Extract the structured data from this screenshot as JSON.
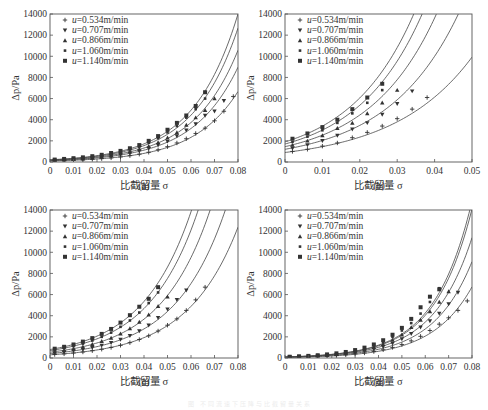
{
  "figure": {
    "caption": "图 不同流速下压降与比截留量关系"
  },
  "legend": {
    "prefix": "u",
    "items": [
      {
        "label": "=0.534m/min",
        "marker": "plus"
      },
      {
        "label": "=0.707m/min",
        "marker": "triangle-down"
      },
      {
        "label": "=0.866m/min",
        "marker": "triangle-up"
      },
      {
        "label": "=1.060m/min",
        "marker": "small-square"
      },
      {
        "label": "=1.140m/min",
        "marker": "square"
      }
    ]
  },
  "colors": {
    "line": "#444444",
    "marker": "#333333",
    "frame": "#555555"
  },
  "panels": [
    {
      "id": "a",
      "tag": "(a)",
      "ylabel": "Δp/Pa",
      "xlabel": "比截留量 σ"
    },
    {
      "id": "b",
      "tag": "(b)",
      "ylabel": "Δp/Pa",
      "xlabel": "比截留量 σ"
    },
    {
      "id": "c",
      "tag": "(c)",
      "ylabel": "Δp/Pa",
      "xlabel": "比截留量 σ"
    },
    {
      "id": "d",
      "tag": "(d)",
      "ylabel": "Δp/Pa",
      "xlabel": "比截留量 σ"
    }
  ],
  "chart_data": [
    {
      "panel": "(a)",
      "type": "scatter",
      "title": "",
      "xlabel": "比截留量 σ",
      "ylabel": "Δp/Pa",
      "xlim": [
        0,
        0.08
      ],
      "ylim": [
        0,
        14000
      ],
      "xticks": [
        0,
        0.01,
        0.02,
        0.03,
        0.04,
        0.05,
        0.06,
        0.07,
        0.08
      ],
      "xtick_labels": [
        "0",
        "0.01",
        "0.02",
        "0.03",
        "0.04",
        "0.05",
        "0.06",
        "0.07",
        "0.08"
      ],
      "yticks": [
        0,
        2000,
        4000,
        6000,
        8000,
        10000,
        12000,
        14000
      ],
      "legend_position": "upper left",
      "grid": false,
      "series": [
        {
          "name": "u=0.534m/min",
          "marker": "plus",
          "fit": {
            "A": 100,
            "k": 52.5
          },
          "x": [
            0.002,
            0.006,
            0.01,
            0.014,
            0.018,
            0.022,
            0.026,
            0.03,
            0.034,
            0.038,
            0.042,
            0.046,
            0.05,
            0.054,
            0.058,
            0.062,
            0.066,
            0.07,
            0.074,
            0.078
          ],
          "y": [
            110,
            130,
            160,
            200,
            250,
            320,
            390,
            480,
            600,
            740,
            920,
            1150,
            1450,
            1800,
            2200,
            2700,
            3200,
            3900,
            4800,
            6200
          ]
        },
        {
          "name": "u=0.707m/min",
          "marker": "triangle-down",
          "fit": {
            "A": 140,
            "k": 52
          },
          "x": [
            0.002,
            0.006,
            0.01,
            0.014,
            0.018,
            0.022,
            0.026,
            0.03,
            0.034,
            0.038,
            0.042,
            0.046,
            0.05,
            0.054,
            0.058,
            0.062,
            0.066,
            0.07,
            0.074
          ],
          "y": [
            150,
            190,
            230,
            290,
            360,
            440,
            550,
            680,
            830,
            1030,
            1280,
            1600,
            1950,
            2450,
            3000,
            3600,
            4400,
            4800,
            5800
          ]
        },
        {
          "name": "u=0.866m/min",
          "marker": "triangle-up",
          "fit": {
            "A": 165,
            "k": 52
          },
          "x": [
            0.002,
            0.006,
            0.01,
            0.014,
            0.018,
            0.022,
            0.026,
            0.03,
            0.034,
            0.038,
            0.042,
            0.046,
            0.05,
            0.054,
            0.058,
            0.062,
            0.066,
            0.07
          ],
          "y": [
            180,
            220,
            280,
            340,
            420,
            520,
            650,
            800,
            980,
            1230,
            1500,
            1850,
            2300,
            2800,
            3500,
            4200,
            4900,
            6000
          ]
        },
        {
          "name": "u=1.060m/min",
          "marker": "small-square",
          "fit": {
            "A": 190,
            "k": 52.5
          },
          "x": [
            0.002,
            0.006,
            0.01,
            0.014,
            0.018,
            0.022,
            0.026,
            0.03,
            0.034,
            0.038,
            0.042,
            0.046,
            0.05,
            0.054,
            0.058,
            0.062,
            0.066
          ],
          "y": [
            210,
            260,
            320,
            400,
            500,
            620,
            770,
            950,
            1180,
            1460,
            1820,
            2250,
            2800,
            3400,
            4200,
            5000,
            6000
          ]
        },
        {
          "name": "u=1.140m/min",
          "marker": "square",
          "fit": {
            "A": 210,
            "k": 52.5
          },
          "x": [
            0.002,
            0.006,
            0.01,
            0.014,
            0.018,
            0.022,
            0.026,
            0.03,
            0.034,
            0.038,
            0.042,
            0.046,
            0.05,
            0.054,
            0.058,
            0.062,
            0.066
          ],
          "y": [
            230,
            290,
            360,
            440,
            550,
            680,
            850,
            1050,
            1300,
            1600,
            2000,
            2450,
            3050,
            3700,
            4400,
            5300,
            6600
          ]
        }
      ]
    },
    {
      "panel": "(b)",
      "type": "scatter",
      "title": "",
      "xlabel": "比截留量 σ",
      "ylabel": "Δp/Pa",
      "xlim": [
        0,
        0.05
      ],
      "ylim": [
        0,
        14000
      ],
      "xticks": [
        0,
        0.01,
        0.02,
        0.03,
        0.04,
        0.05
      ],
      "xtick_labels": [
        "0",
        "0.01",
        "0.02",
        "0.03",
        "0.04",
        "0.05"
      ],
      "yticks": [
        0,
        2000,
        4000,
        6000,
        8000,
        10000,
        12000,
        14000
      ],
      "legend_position": "upper left",
      "grid": false,
      "series": [
        {
          "name": "u=0.534m/min",
          "marker": "plus",
          "fit": {
            "A": 900,
            "k": 48
          },
          "x": [
            0.002,
            0.006,
            0.01,
            0.014,
            0.018,
            0.022,
            0.026,
            0.03,
            0.034,
            0.038
          ],
          "y": [
            1000,
            1200,
            1500,
            1800,
            2300,
            2800,
            3400,
            4100,
            5000,
            6100
          ]
        },
        {
          "name": "u=0.707m/min",
          "marker": "triangle-down",
          "fit": {
            "A": 1200,
            "k": 53
          },
          "x": [
            0.002,
            0.006,
            0.01,
            0.014,
            0.018,
            0.022,
            0.026,
            0.03,
            0.034
          ],
          "y": [
            1300,
            1600,
            2000,
            2500,
            3100,
            3700,
            4500,
            5500,
            6700
          ]
        },
        {
          "name": "u=0.866m/min",
          "marker": "triangle-up",
          "fit": {
            "A": 1450,
            "k": 56
          },
          "x": [
            0.002,
            0.006,
            0.01,
            0.014,
            0.018,
            0.022,
            0.026,
            0.03
          ],
          "y": [
            1600,
            2000,
            2500,
            3200,
            3700,
            4600,
            5600,
            6800
          ]
        },
        {
          "name": "u=1.060m/min",
          "marker": "small-square",
          "fit": {
            "A": 1700,
            "k": 57.5
          },
          "x": [
            0.002,
            0.006,
            0.01,
            0.014,
            0.018,
            0.022,
            0.026
          ],
          "y": [
            1900,
            2400,
            3000,
            3700,
            4600,
            5600,
            6800
          ]
        },
        {
          "name": "u=1.140m/min",
          "marker": "square",
          "fit": {
            "A": 1900,
            "k": 58
          },
          "x": [
            0.002,
            0.006,
            0.01,
            0.014,
            0.018,
            0.022,
            0.026
          ],
          "y": [
            2200,
            2700,
            3300,
            4000,
            5000,
            6100,
            7400
          ]
        }
      ]
    },
    {
      "panel": "(c)",
      "type": "scatter",
      "title": "",
      "xlabel": "比截留量 σ",
      "ylabel": "Δp/Pa",
      "xlim": [
        0,
        0.08
      ],
      "ylim": [
        0,
        14000
      ],
      "xticks": [
        0,
        0.01,
        0.02,
        0.03,
        0.04,
        0.05,
        0.06,
        0.07,
        0.08
      ],
      "xtick_labels": [
        "0",
        "0.01",
        "0.02",
        "0.03",
        "0.04",
        "0.05",
        "0.06",
        "0.07",
        "0.08"
      ],
      "yticks": [
        0,
        2000,
        4000,
        6000,
        8000,
        10000,
        12000,
        14000
      ],
      "legend_position": "upper left",
      "grid": false,
      "series": [
        {
          "name": "u=0.534m/min",
          "marker": "plus",
          "fit": {
            "A": 300,
            "k": 46.5
          },
          "x": [
            0.002,
            0.006,
            0.01,
            0.014,
            0.018,
            0.022,
            0.026,
            0.03,
            0.034,
            0.038,
            0.042,
            0.046,
            0.05,
            0.054,
            0.058,
            0.062,
            0.066
          ],
          "y": [
            330,
            390,
            470,
            570,
            690,
            830,
            1000,
            1200,
            1450,
            1750,
            2100,
            2550,
            3100,
            3700,
            4500,
            5500,
            6700
          ]
        },
        {
          "name": "u=0.707m/min",
          "marker": "triangle-down",
          "fit": {
            "A": 420,
            "k": 47
          },
          "x": [
            0.002,
            0.006,
            0.01,
            0.014,
            0.018,
            0.022,
            0.026,
            0.03,
            0.034,
            0.038,
            0.042,
            0.046,
            0.05,
            0.054,
            0.058
          ],
          "y": [
            460,
            560,
            670,
            810,
            980,
            1190,
            1440,
            1750,
            2100,
            2550,
            3100,
            3800,
            4600,
            5500,
            6400
          ]
        },
        {
          "name": "u=0.866m/min",
          "marker": "triangle-up",
          "fit": {
            "A": 550,
            "k": 47.5
          },
          "x": [
            0.002,
            0.006,
            0.01,
            0.014,
            0.018,
            0.022,
            0.026,
            0.03,
            0.034,
            0.038,
            0.042,
            0.046,
            0.05
          ],
          "y": [
            600,
            730,
            880,
            1070,
            1300,
            1580,
            1900,
            2300,
            2800,
            3400,
            4100,
            4900,
            5800
          ]
        },
        {
          "name": "u=1.060m/min",
          "marker": "small-square",
          "fit": {
            "A": 700,
            "k": 47.5
          },
          "x": [
            0.002,
            0.006,
            0.01,
            0.014,
            0.018,
            0.022,
            0.026,
            0.03,
            0.034,
            0.038,
            0.042,
            0.046
          ],
          "y": [
            770,
            930,
            1120,
            1360,
            1650,
            2000,
            2400,
            2950,
            3550,
            4300,
            5200,
            6200
          ]
        },
        {
          "name": "u=1.140m/min",
          "marker": "square",
          "fit": {
            "A": 800,
            "k": 47.5
          },
          "x": [
            0.002,
            0.006,
            0.01,
            0.014,
            0.018,
            0.022,
            0.026,
            0.03,
            0.034,
            0.038,
            0.042,
            0.046
          ],
          "y": [
            880,
            1060,
            1280,
            1550,
            1880,
            2280,
            2750,
            3350,
            4050,
            4850,
            5600,
            6700
          ]
        }
      ]
    },
    {
      "panel": "(d)",
      "type": "scatter",
      "title": "",
      "xlabel": "比截留量 σ",
      "ylabel": "Δp/Pa",
      "xlim": [
        0,
        0.08
      ],
      "ylim": [
        0,
        14000
      ],
      "xticks": [
        0,
        0.01,
        0.02,
        0.03,
        0.04,
        0.05,
        0.06,
        0.07,
        0.08
      ],
      "xtick_labels": [
        "0",
        "0.01",
        "0.02",
        "0.03",
        "0.04",
        "0.05",
        "0.06",
        "0.07",
        "0.08"
      ],
      "yticks": [
        0,
        2000,
        4000,
        6000,
        8000,
        10000,
        12000,
        14000
      ],
      "legend_position": "upper left",
      "grid": false,
      "series": [
        {
          "name": "u=0.534m/min",
          "marker": "plus",
          "fit": {
            "A": 60,
            "k": 59
          },
          "x": [
            0.002,
            0.006,
            0.01,
            0.014,
            0.018,
            0.022,
            0.026,
            0.03,
            0.034,
            0.038,
            0.042,
            0.046,
            0.05,
            0.054,
            0.058,
            0.062,
            0.066,
            0.07,
            0.074,
            0.078
          ],
          "y": [
            70,
            90,
            110,
            140,
            180,
            230,
            300,
            380,
            480,
            610,
            780,
            1000,
            1270,
            1620,
            2050,
            2600,
            3200,
            3800,
            4500,
            5400
          ]
        },
        {
          "name": "u=0.707m/min",
          "marker": "triangle-down",
          "fit": {
            "A": 75,
            "k": 60
          },
          "x": [
            0.002,
            0.006,
            0.01,
            0.014,
            0.018,
            0.022,
            0.026,
            0.03,
            0.034,
            0.038,
            0.042,
            0.046,
            0.05,
            0.054,
            0.058,
            0.062,
            0.066,
            0.07,
            0.074
          ],
          "y": [
            85,
            110,
            140,
            180,
            230,
            300,
            380,
            500,
            640,
            830,
            1070,
            1380,
            1800,
            2300,
            2900,
            3500,
            4200,
            5100,
            6200
          ]
        },
        {
          "name": "u=0.866m/min",
          "marker": "triangle-up",
          "fit": {
            "A": 90,
            "k": 60.5
          },
          "x": [
            0.002,
            0.006,
            0.01,
            0.014,
            0.018,
            0.022,
            0.026,
            0.03,
            0.034,
            0.038,
            0.042,
            0.046,
            0.05,
            0.054,
            0.058,
            0.062,
            0.066,
            0.07
          ],
          "y": [
            100,
            130,
            170,
            210,
            280,
            360,
            470,
            600,
            780,
            1010,
            1300,
            1700,
            2200,
            2900,
            3600,
            4400,
            5300,
            6300
          ]
        },
        {
          "name": "u=1.060m/min",
          "marker": "small-square",
          "fit": {
            "A": 95,
            "k": 62.5
          },
          "x": [
            0.002,
            0.006,
            0.01,
            0.014,
            0.018,
            0.022,
            0.026,
            0.03,
            0.034,
            0.038,
            0.042,
            0.046,
            0.05,
            0.054,
            0.058,
            0.062,
            0.066
          ],
          "y": [
            110,
            140,
            180,
            230,
            300,
            390,
            510,
            670,
            880,
            1150,
            1500,
            2000,
            2600,
            3300,
            4200,
            5300,
            6600
          ]
        },
        {
          "name": "u=1.140m/min",
          "marker": "square",
          "fit": {
            "A": 100,
            "k": 62.5
          },
          "x": [
            0.002,
            0.006,
            0.01,
            0.014,
            0.018,
            0.022,
            0.026,
            0.03,
            0.034,
            0.038,
            0.042,
            0.046,
            0.05,
            0.054,
            0.058,
            0.062,
            0.066
          ],
          "y": [
            120,
            160,
            200,
            260,
            340,
            440,
            570,
            750,
            980,
            1280,
            1680,
            2200,
            2850,
            3700,
            4800,
            5800,
            6500
          ]
        }
      ]
    }
  ]
}
